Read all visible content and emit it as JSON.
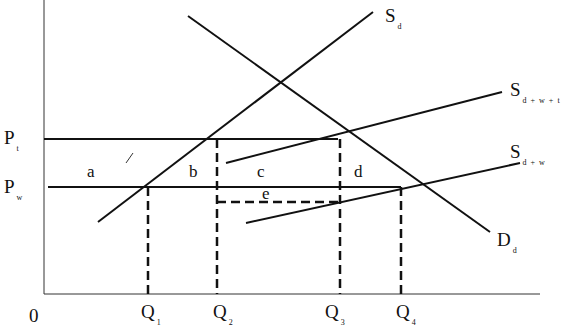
{
  "diagram": {
    "type": "economics-supply-demand-tariff",
    "axes": {
      "origin_label": "0",
      "x_ticks": [
        {
          "main": "Q",
          "sub": "1"
        },
        {
          "main": "Q",
          "sub": "2"
        },
        {
          "main": "Q",
          "sub": "3"
        },
        {
          "main": "Q",
          "sub": "4"
        }
      ],
      "y_ticks": [
        {
          "main": "P",
          "sub": "t"
        },
        {
          "main": "P",
          "sub": "w"
        }
      ]
    },
    "curves": {
      "domestic_supply": {
        "main": "S",
        "sub": "d"
      },
      "supply_with_world_and_tariff": {
        "main": "S",
        "sub": "d + w + t"
      },
      "supply_with_world": {
        "main": "S",
        "sub": "d + w"
      },
      "domestic_demand": {
        "main": "D",
        "sub": "d"
      }
    },
    "areas": {
      "a": "a",
      "b": "b",
      "c": "c",
      "d": "d",
      "e": "e"
    },
    "line_color": "#111111"
  }
}
